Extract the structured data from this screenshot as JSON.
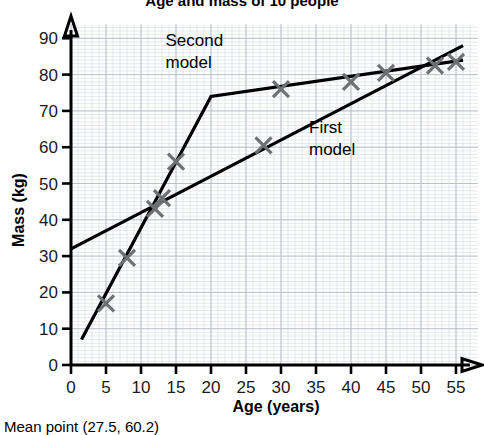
{
  "chart_data": {
    "type": "scatter",
    "title": "Age and mass of 10 people",
    "xlabel": "Age (years)",
    "ylabel": "Mass (kg)",
    "xlim": [
      0,
      57
    ],
    "ylim": [
      0,
      95
    ],
    "xticks": [
      "0",
      "5",
      "10",
      "15",
      "20",
      "25",
      "30",
      "35",
      "40",
      "45",
      "50",
      "55"
    ],
    "yticks": [
      "0",
      "10",
      "20",
      "30",
      "40",
      "50",
      "60",
      "70",
      "80",
      "90"
    ],
    "grid": true,
    "legend_position": "inline-annotations",
    "points": [
      {
        "x": 5,
        "y": 17
      },
      {
        "x": 8,
        "y": 29.5
      },
      {
        "x": 12,
        "y": 43
      },
      {
        "x": 13,
        "y": 46
      },
      {
        "x": 15,
        "y": 56
      },
      {
        "x": 27.5,
        "y": 60.5
      },
      {
        "x": 30,
        "y": 76
      },
      {
        "x": 40,
        "y": 78
      },
      {
        "x": 45,
        "y": 80.5
      },
      {
        "x": 52,
        "y": 82.5
      },
      {
        "x": 55,
        "y": 83.5
      }
    ],
    "series": [
      {
        "name": "First model",
        "type": "line",
        "points": [
          {
            "x": 0,
            "y": 32
          },
          {
            "x": 56,
            "y": 88
          }
        ]
      },
      {
        "name": "Second model",
        "type": "line",
        "points": [
          {
            "x": 1.5,
            "y": 7
          },
          {
            "x": 20,
            "y": 74
          },
          {
            "x": 56,
            "y": 84
          }
        ]
      }
    ],
    "annotations": [
      {
        "label": "Second model",
        "x": 13.5,
        "y": 88
      },
      {
        "label": "First model",
        "x": 34,
        "y": 64
      }
    ],
    "footnote": "Mean point (27.5, 60.2)"
  },
  "marker": {
    "style": "x-cross",
    "color": "#6e7072",
    "size": 16
  },
  "colors": {
    "axis": "#000000",
    "grid_minor": "#cfd3da",
    "grid_major": "#b2b8c2",
    "model_line": "#000000",
    "marker": "#6e7072"
  }
}
